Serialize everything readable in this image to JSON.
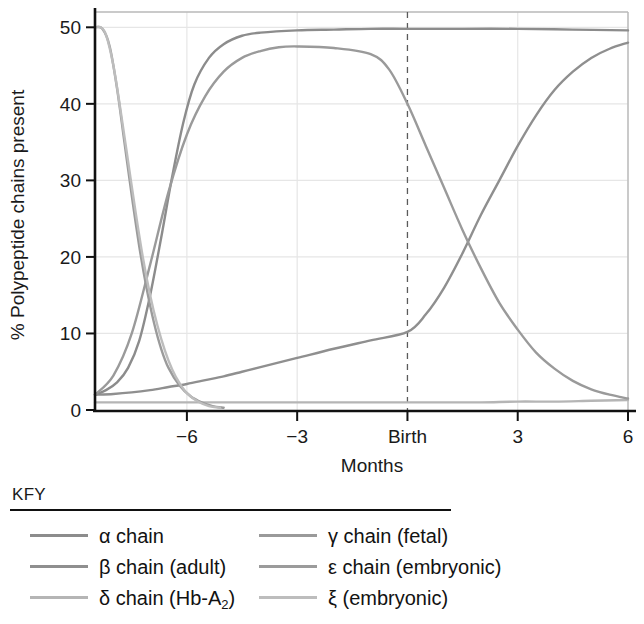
{
  "chart_data": {
    "type": "line",
    "title": "",
    "xlabel": "Months",
    "ylabel": "% Polypeptide chains present",
    "xlim": [
      -8.5,
      6
    ],
    "ylim": [
      0,
      52
    ],
    "grid": true,
    "x_ticks": [
      {
        "value": -6,
        "label": "−6"
      },
      {
        "value": -3,
        "label": "−3"
      },
      {
        "value": 0,
        "label": "Birth"
      },
      {
        "value": 3,
        "label": "3"
      },
      {
        "value": 6,
        "label": "6"
      }
    ],
    "y_ticks": [
      {
        "value": 0,
        "label": "0"
      },
      {
        "value": 10,
        "label": "10"
      },
      {
        "value": 20,
        "label": "20"
      },
      {
        "value": 30,
        "label": "30"
      },
      {
        "value": 40,
        "label": "40"
      },
      {
        "value": 50,
        "label": "50"
      }
    ],
    "annotations": [
      {
        "type": "vline",
        "x": 0,
        "label": "Birth",
        "style": "dashed"
      }
    ],
    "series": [
      {
        "name": "α chain",
        "color": "#8c8c8c",
        "x": [
          -8.5,
          -8.2,
          -7.9,
          -7.6,
          -7.3,
          -7.0,
          -6.7,
          -6.4,
          -6.1,
          -5.8,
          -5.4,
          -5.0,
          -4.5,
          -4.0,
          -3.0,
          -2.0,
          -1.0,
          0.0,
          1.5,
          3.0,
          4.5,
          6.0
        ],
        "y": [
          2.0,
          2.6,
          3.6,
          5.5,
          9.0,
          15.0,
          22.5,
          30.5,
          37.5,
          42.5,
          46.0,
          47.8,
          48.9,
          49.3,
          49.6,
          49.7,
          49.8,
          49.8,
          49.8,
          49.8,
          49.7,
          49.6
        ]
      },
      {
        "name": "β chain (adult)",
        "color": "#8f8f8f",
        "x": [
          -8.5,
          -8.0,
          -7.5,
          -7.0,
          -6.5,
          -6.0,
          -5.5,
          -5.0,
          -4.5,
          -4.0,
          -3.0,
          -2.0,
          -1.0,
          0.0,
          0.5,
          1.0,
          1.5,
          2.0,
          2.5,
          3.0,
          3.5,
          4.0,
          4.5,
          5.0,
          5.5,
          6.0
        ],
        "y": [
          2.0,
          2.1,
          2.3,
          2.6,
          3.0,
          3.4,
          3.9,
          4.4,
          5.0,
          5.6,
          6.8,
          8.0,
          9.1,
          10.2,
          12.5,
          16.0,
          20.5,
          25.5,
          30.0,
          34.5,
          38.5,
          41.8,
          44.2,
          46.0,
          47.2,
          48.0
        ]
      },
      {
        "name": "δ chain (Hb-A₂)",
        "color": "#b5b5b5",
        "x": [
          -8.5,
          -7.0,
          -6.0,
          -5.0,
          -4.0,
          -3.0,
          -2.0,
          -1.0,
          0.0,
          1.0,
          2.0,
          3.0,
          4.0,
          5.0,
          6.0
        ],
        "y": [
          1.0,
          1.0,
          1.0,
          1.0,
          1.0,
          1.0,
          1.0,
          1.0,
          1.0,
          1.0,
          1.0,
          1.1,
          1.1,
          1.2,
          1.3
        ]
      },
      {
        "name": "γ chain (fetal)",
        "color": "#9a9a9a",
        "x": [
          -8.5,
          -8.0,
          -7.5,
          -7.0,
          -6.5,
          -6.0,
          -5.5,
          -5.0,
          -4.5,
          -4.0,
          -3.5,
          -3.0,
          -2.0,
          -1.0,
          -0.5,
          0.0,
          0.5,
          1.0,
          1.5,
          2.0,
          2.5,
          3.0,
          3.5,
          4.0,
          4.5,
          5.0,
          5.5,
          6.0
        ],
        "y": [
          2.0,
          4.5,
          10.0,
          19.0,
          28.5,
          36.0,
          41.0,
          44.2,
          46.0,
          46.9,
          47.4,
          47.5,
          47.3,
          46.5,
          44.5,
          40.0,
          34.5,
          29.0,
          23.5,
          18.5,
          14.0,
          10.5,
          7.5,
          5.4,
          3.8,
          2.7,
          2.0,
          1.5
        ]
      },
      {
        "name": "ε chain (embryonic)",
        "color": "#9b9b9b",
        "x": [
          -8.5,
          -8.3,
          -8.1,
          -7.9,
          -7.7,
          -7.5,
          -7.3,
          -7.1,
          -6.9,
          -6.7,
          -6.5,
          -6.2,
          -5.9,
          -5.6,
          -5.3,
          -5.0
        ],
        "y": [
          50.0,
          49.8,
          47.5,
          42.0,
          35.0,
          28.0,
          21.5,
          16.0,
          11.5,
          8.0,
          5.5,
          3.2,
          1.8,
          1.0,
          0.5,
          0.3
        ]
      },
      {
        "name": "ξ (embryonic)",
        "color": "#bdbdbd",
        "x": [
          -8.5,
          -8.35,
          -8.2,
          -8.0,
          -7.8,
          -7.6,
          -7.4,
          -7.2,
          -7.0,
          -6.8,
          -6.6,
          -6.4,
          -6.2,
          -6.0,
          -5.7,
          -5.4,
          -5.1
        ],
        "y": [
          50.0,
          50.0,
          49.0,
          45.0,
          39.0,
          32.5,
          26.0,
          20.0,
          15.0,
          11.0,
          7.8,
          5.3,
          3.5,
          2.2,
          1.1,
          0.5,
          0.3
        ]
      }
    ]
  },
  "chart": {
    "ylabel": "% Polypeptide chains present",
    "xlabel": "Months"
  },
  "legend": {
    "title": "KFY",
    "entries_left": [
      {
        "label": "α chain",
        "color": "#8c8c8c"
      },
      {
        "label": "β chain (adult)",
        "color": "#8f8f8f"
      },
      {
        "label": "δ chain (Hb-A",
        "sub": "2",
        "tail": ")",
        "color": "#b5b5b5"
      }
    ],
    "entries_right": [
      {
        "label": "γ chain (fetal)",
        "color": "#9a9a9a"
      },
      {
        "label": "ε chain (embryonic)",
        "color": "#9b9b9b"
      },
      {
        "label": "ξ (embryonic)",
        "color": "#bdbdbd"
      }
    ]
  }
}
